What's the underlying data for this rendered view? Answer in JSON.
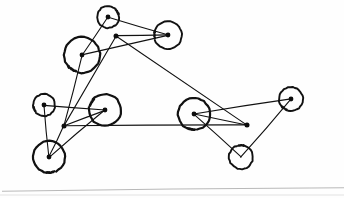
{
  "document": {
    "title": "Hand-drawn graph sketch",
    "kind": "scanned-line-drawing",
    "background_color": "#fefefe",
    "ink_color": "#111111",
    "baseline_color": "#b9b9b9",
    "width": 344,
    "height": 198
  },
  "graph": {
    "description": "Hand-drawn node-link diagram: circled vertices with center dots plus three bare dots, joined by straight pen strokes.",
    "node_count": 11,
    "edge_count": 17,
    "nodes": [
      {
        "id": "n1",
        "label": "top-small-circle",
        "cx": 108,
        "cy": 17,
        "r": 11,
        "shape": "circle",
        "has_center_dot": true,
        "gap_angle": -35
      },
      {
        "id": "n2",
        "label": "top-right-circle",
        "cx": 168,
        "cy": 35,
        "r": 14,
        "shape": "circle",
        "has_center_dot": true,
        "gap_angle": 175
      },
      {
        "id": "n3",
        "label": "top-left-large-circle",
        "cx": 82,
        "cy": 55,
        "r": 18,
        "shape": "circle",
        "has_center_dot": true,
        "gap_angle": 120
      },
      {
        "id": "n4",
        "label": "top-free-dot",
        "cx": 116,
        "cy": 36,
        "r": 0,
        "shape": "dot",
        "has_center_dot": true,
        "gap_angle": 0
      },
      {
        "id": "n5",
        "label": "mid-left-small-circle",
        "cx": 44,
        "cy": 105,
        "r": 11,
        "shape": "circle",
        "has_center_dot": true,
        "gap_angle": 150
      },
      {
        "id": "n6",
        "label": "mid-left-large-circle",
        "cx": 105,
        "cy": 110,
        "r": 16,
        "shape": "circle",
        "has_center_dot": true,
        "gap_angle": 205
      },
      {
        "id": "n7",
        "label": "mid-left-free-dot",
        "cx": 64,
        "cy": 126,
        "r": 0,
        "shape": "dot",
        "has_center_dot": true,
        "gap_angle": 0
      },
      {
        "id": "n8",
        "label": "bottom-left-circle",
        "cx": 49,
        "cy": 157,
        "r": 16,
        "shape": "circle",
        "has_center_dot": true,
        "gap_angle": 80
      },
      {
        "id": "n9",
        "label": "center-right-circle",
        "cx": 194,
        "cy": 114,
        "r": 16,
        "shape": "circle",
        "has_center_dot": true,
        "gap_angle": 95
      },
      {
        "id": "n10",
        "label": "right-free-dot",
        "cx": 247,
        "cy": 125,
        "r": 0,
        "shape": "dot",
        "has_center_dot": true,
        "gap_angle": 0
      },
      {
        "id": "n11",
        "label": "far-right-circle",
        "cx": 291,
        "cy": 99,
        "r": 12,
        "shape": "circle",
        "has_center_dot": true,
        "gap_angle": 120
      },
      {
        "id": "n12",
        "label": "bottom-right-circle",
        "cx": 241,
        "cy": 157,
        "r": 12,
        "shape": "circle",
        "has_center_dot": false,
        "gap_angle": 265
      }
    ],
    "edges": [
      {
        "from": "n1",
        "to": "n2"
      },
      {
        "from": "n1",
        "to": "n3"
      },
      {
        "from": "n4",
        "to": "n2"
      },
      {
        "from": "n3",
        "to": "n2"
      },
      {
        "from": "n4",
        "to": "n7"
      },
      {
        "from": "n4",
        "to": "n10"
      },
      {
        "from": "n3",
        "to": "n7"
      },
      {
        "from": "n5",
        "to": "n6"
      },
      {
        "from": "n5",
        "to": "n8"
      },
      {
        "from": "n7",
        "to": "n6"
      },
      {
        "from": "n7",
        "to": "n8"
      },
      {
        "from": "n7",
        "to": "n10"
      },
      {
        "from": "n6",
        "to": "n8"
      },
      {
        "from": "n9",
        "to": "n11"
      },
      {
        "from": "n9",
        "to": "n10"
      },
      {
        "from": "n9",
        "to": "n12"
      },
      {
        "from": "n11",
        "to": "n12"
      }
    ]
  },
  "annotations": {
    "baseline": {
      "visible": true,
      "y": 190,
      "x_start": 2,
      "x_end": 344
    },
    "paper_edge": {
      "visible": true,
      "y": 195
    }
  }
}
